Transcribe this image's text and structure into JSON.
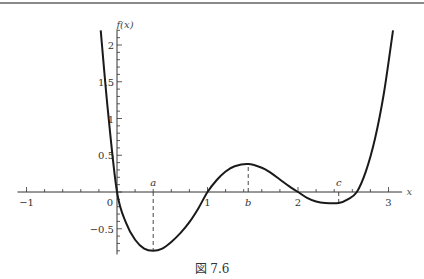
{
  "figure": {
    "caption": "図 7.6"
  },
  "chart_data": {
    "type": "line",
    "title": "",
    "xlabel": "x",
    "ylabel": "f(x)",
    "xlim": [
      -1.1,
      3.2
    ],
    "ylim": [
      -0.85,
      2.2
    ],
    "x_ticks": [
      -1,
      0,
      1,
      2,
      3
    ],
    "x_tick_labels": [
      "−1",
      "0",
      "1",
      "2",
      "3"
    ],
    "y_ticks": [
      -0.5,
      0.5,
      1,
      1.5,
      2
    ],
    "y_tick_labels": [
      "−0.5",
      "0.5",
      "1",
      "1.5",
      "2"
    ],
    "grid": false,
    "legend": null,
    "series": [
      {
        "name": "f(x)",
        "x": [
          -0.18,
          -0.1,
          0,
          0.1,
          0.2,
          0.3,
          0.4,
          0.5,
          0.6,
          0.7,
          0.8,
          0.9,
          1.0,
          1.1,
          1.2,
          1.3,
          1.45,
          1.6,
          1.7,
          1.8,
          1.9,
          2.0,
          2.1,
          2.2,
          2.3,
          2.45,
          2.55,
          2.65,
          2.75,
          2.85,
          2.95,
          3.05
        ],
        "y": [
          2.2,
          1.1,
          0,
          -0.42,
          -0.65,
          -0.77,
          -0.8,
          -0.77,
          -0.68,
          -0.56,
          -0.41,
          -0.22,
          0,
          0.16,
          0.28,
          0.35,
          0.38,
          0.33,
          0.26,
          0.17,
          0.08,
          0,
          -0.08,
          -0.13,
          -0.15,
          -0.15,
          -0.1,
          0,
          0.28,
          0.72,
          1.35,
          2.2
        ]
      }
    ],
    "annotations": [
      {
        "label": "a",
        "x": 0.4,
        "y": -0.8,
        "note": "local minimum, dashed line to x-axis"
      },
      {
        "label": "b",
        "x": 1.45,
        "y": 0.38,
        "note": "local maximum, dashed line to x-axis"
      },
      {
        "label": "c",
        "x": 2.45,
        "y": -0.15,
        "note": "local minimum, dashed line to x-axis"
      }
    ]
  }
}
